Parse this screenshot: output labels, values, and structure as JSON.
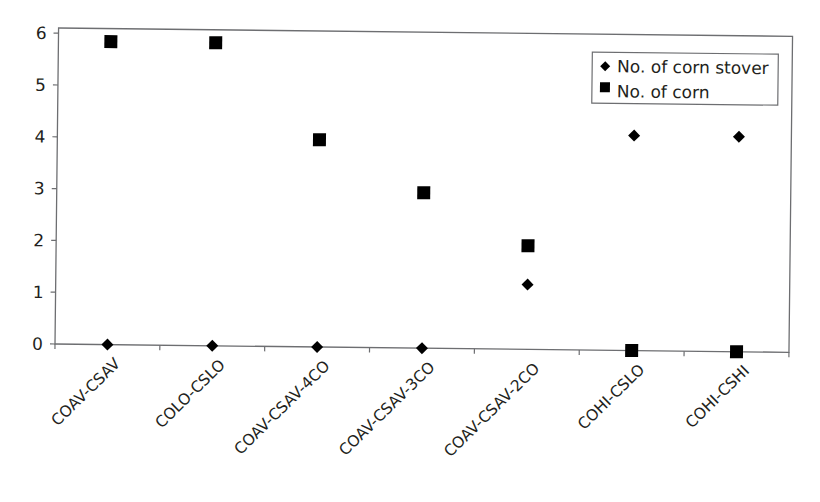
{
  "chart_data": {
    "type": "scatter",
    "title": "",
    "xlabel": "",
    "ylabel": "",
    "ylim": [
      0,
      6
    ],
    "yticks": [
      0,
      1,
      2,
      3,
      4,
      5,
      6
    ],
    "grid": false,
    "legend_position": "upper right (inside plot)",
    "categories": [
      "COAV-CSAV",
      "COLO-CSLO",
      "COAV-CSAV-4CO",
      "COAV-CSAV-3CO",
      "COAV-CSAV-2CO",
      "COHI-CSLO",
      "COHI-CSHI"
    ],
    "series": [
      {
        "name": "No. of corn stover",
        "marker": "diamond",
        "color": "#000000",
        "values": [
          0,
          0,
          0,
          0,
          1.25,
          4.15,
          4.15
        ]
      },
      {
        "name": "No. of corn",
        "marker": "square",
        "color": "#000000",
        "values": [
          5.85,
          5.85,
          4,
          3,
          2,
          0,
          0
        ]
      }
    ]
  },
  "legend": {
    "items": [
      {
        "label": "No. of corn stover",
        "marker": "diamond"
      },
      {
        "label": "No. of corn",
        "marker": "square"
      }
    ]
  },
  "colors": {
    "axis": "#6d6e71",
    "marker": "#000000",
    "text": "#231f20"
  }
}
